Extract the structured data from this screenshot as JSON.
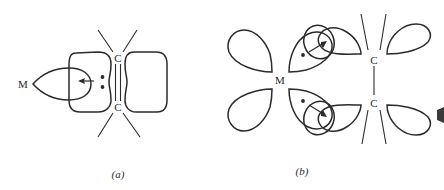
{
  "figure": {
    "panels": [
      {
        "id": "a",
        "label": "(a)",
        "atoms": {
          "metal": "M",
          "carbon_top": "C",
          "carbon_bottom": "C"
        },
        "bond_between_carbons": "double",
        "electron_dots": 2,
        "arrow_direction": "toward metal (left)"
      },
      {
        "id": "b",
        "label": "(b)",
        "atoms": {
          "metal": "M",
          "carbon_top": "C",
          "carbon_bottom": "C"
        },
        "bond_between_carbons": "single",
        "electron_dots": 2,
        "arrow_direction": "away from metal (toward carbons)"
      }
    ]
  },
  "colors": {
    "stroke": "#2b2b2b",
    "background": "#ffffff"
  }
}
